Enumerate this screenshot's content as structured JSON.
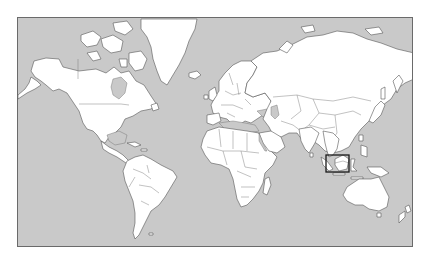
{
  "map": {
    "type": "world-locator-map",
    "projection": "Mercator",
    "colors": {
      "ocean": "#c9c9c9",
      "land": "#ffffff",
      "coastline": "#555555",
      "frame": "#6a6a6a",
      "highlight": "#1a1a1a"
    },
    "highlight_region": {
      "label": "Malaysia (Peninsular Malaysia & northern Borneo)",
      "box_px": {
        "x": 325,
        "y": 154,
        "width": 23,
        "height": 17
      }
    },
    "continents": [
      "North America",
      "Greenland",
      "South America",
      "Europe",
      "Africa",
      "Asia",
      "Australia",
      "New Zealand",
      "Antarctica (not shown)"
    ]
  }
}
